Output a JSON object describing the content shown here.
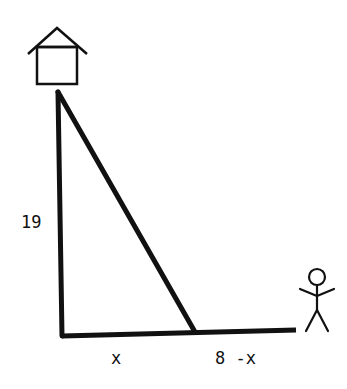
{
  "diagram": {
    "type": "right-triangle-word-problem",
    "labels": {
      "height": "19",
      "base_left": "x",
      "base_right": "8 -x"
    },
    "icons": {
      "top": "house-icon",
      "right": "stick-figure-person-icon"
    },
    "colors": {
      "stroke": "#111111",
      "background": "#ffffff"
    }
  }
}
